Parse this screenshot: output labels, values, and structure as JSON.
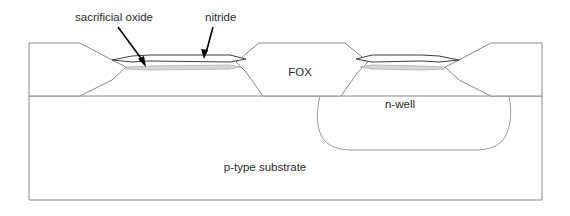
{
  "figure": {
    "background_color": "#ffffff",
    "outline_color": "#8a8a8a",
    "nitride_color": "#3c3c3c",
    "oxide_color": "#d6d6d6",
    "text_color": "#2b2b2b"
  },
  "callouts": [
    {
      "id": "sacrificial-oxide",
      "label": "sacrificial oxide",
      "text_x": 75,
      "text_y": 18,
      "arrow_from_x": 118,
      "arrow_from_y": 27,
      "arrow_to_x": 146,
      "arrow_to_y": 66
    },
    {
      "id": "nitride",
      "label": "nitride",
      "text_x": 205,
      "text_y": 18,
      "arrow_from_x": 212,
      "arrow_from_y": 27,
      "arrow_to_x": 205,
      "arrow_to_y": 59
    }
  ],
  "regions": [
    {
      "id": "center-fox",
      "label": "FOX",
      "label_x": 300,
      "label_y": 73
    },
    {
      "id": "n-well",
      "label": "n-well",
      "label_x": 400,
      "label_y": 105
    },
    {
      "id": "p-type-substrate",
      "label": "p-type substrate",
      "label_x": 265,
      "label_y": 168
    }
  ],
  "layers": {
    "nitride_name": "nitride",
    "sacrificial_oxide_name": "sacrificial oxide",
    "field_oxide_name": "FOX",
    "substrate_name": "p-type substrate",
    "well_name": "n-well"
  },
  "geometry": {
    "substrate_left": 29,
    "substrate_right": 542,
    "substrate_top": 96,
    "substrate_bottom": 200,
    "surface_y": 96,
    "fox_top_y": 43,
    "nitride_top_y": 56,
    "nitride_bottom_y": 62,
    "oxide_top_y": 65,
    "oxide_bottom_y": 70
  }
}
